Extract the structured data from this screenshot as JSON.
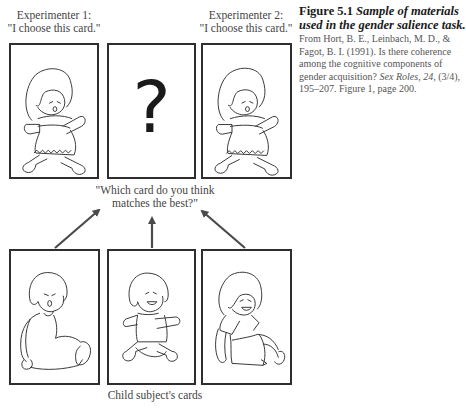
{
  "figure": {
    "number_label": "Figure 5.1",
    "title": "Sample of materials used in the gender salience task.",
    "source_prefix": "From Hort, B. E., Leinbach, M. D., & Fagot, B. I. (1991). Is there coherence among the cognitive components of gender acquisition?",
    "journal": "Sex Roles, 24,",
    "source_suffix": "(3/4), 195–207. Figure 1, page 200."
  },
  "experimenters": [
    {
      "name": "Experimenter 1:",
      "quote": "\"I choose this card.\""
    },
    {
      "name": "Experimenter 2:",
      "quote": "\"I choose this card.\""
    }
  ],
  "top_cards": [
    {
      "content": "girl-running-doll"
    },
    {
      "content": "question-mark",
      "symbol": "?"
    },
    {
      "content": "girl-running-doll"
    }
  ],
  "question": {
    "line1": "\"Which card do you think",
    "line2": "matches the best?\""
  },
  "bottom_cards": [
    {
      "content": "boy-sitting-doll"
    },
    {
      "content": "boy-running-doll"
    },
    {
      "content": "girl-sitting-doll"
    }
  ],
  "bottom_caption": "Child subject's cards",
  "colors": {
    "card_border": "#2e2e2e",
    "arrow": "#4a4a4a",
    "text": "#444444"
  }
}
